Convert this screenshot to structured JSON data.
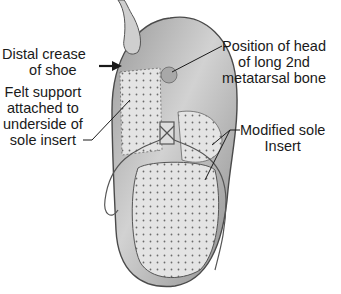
{
  "diagram": {
    "labels": [
      {
        "id": "distal-crease",
        "lines": [
          "Distal crease",
          "of shoe"
        ]
      },
      {
        "id": "felt-support",
        "lines": [
          "Felt support",
          "attached to",
          "underside of",
          "sole insert"
        ]
      },
      {
        "id": "metatarsal-head",
        "lines": [
          "Position of head",
          "of long 2nd",
          "metatarsal bone"
        ]
      },
      {
        "id": "modified-sole",
        "lines": [
          "Modified sole",
          "Insert"
        ]
      }
    ]
  }
}
